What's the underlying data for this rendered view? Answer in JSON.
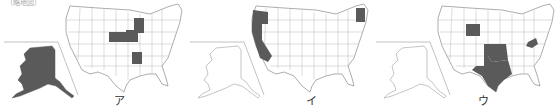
{
  "caption": "（略地図）",
  "colors": {
    "shaded": "#5a5a5a",
    "outline": "#8a8a8a",
    "fill": "#ffffff"
  },
  "maps": [
    {
      "label": "ア",
      "shaded_states": [
        "Alaska",
        "Nebraska",
        "Iowa",
        "Wisconsin",
        "Arkansas"
      ]
    },
    {
      "label": "イ",
      "shaded_states": [
        "Oregon",
        "California",
        "Vermont",
        "New Hampshire"
      ]
    },
    {
      "label": "ウ",
      "shaded_states": [
        "Wyoming",
        "Oklahoma",
        "Texas",
        "West Virginia"
      ]
    }
  ]
}
